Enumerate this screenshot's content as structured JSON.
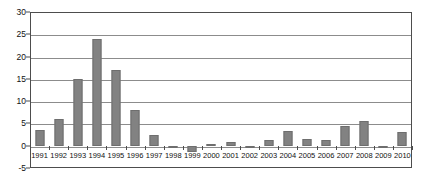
{
  "chart_data": {
    "type": "bar",
    "title": "",
    "subtitle": "",
    "xlabel": "",
    "ylabel": "",
    "categories": [
      "1991",
      "1992",
      "1993",
      "1994",
      "1995",
      "1996",
      "1997",
      "1998",
      "1999",
      "2000",
      "2001",
      "2002",
      "2003",
      "2004",
      "2005",
      "2006",
      "2007",
      "2008",
      "2009",
      "2010"
    ],
    "values": [
      3.5,
      6.0,
      15.0,
      24.0,
      17.0,
      8.0,
      2.5,
      -0.4,
      -1.5,
      0.4,
      0.8,
      -0.5,
      1.2,
      3.3,
      1.5,
      1.2,
      4.5,
      5.5,
      -0.4,
      3.0
    ],
    "ylim": [
      -5,
      30
    ],
    "ytick_step": 5,
    "yticks": [
      -5,
      0,
      5,
      10,
      15,
      20,
      25,
      30
    ],
    "ytick_labels": [
      "-5",
      "0",
      "5",
      "10",
      "15",
      "20",
      "25",
      "30"
    ],
    "grid": true,
    "grid_axis": "y",
    "legend": false,
    "legend_position": "none",
    "bar_color": "#828282",
    "bar_edge_color": "#6e6e6e",
    "grid_color": "#8c8c8c",
    "frame_color": "#4d4d4d",
    "background_color": "#ffffff",
    "text_color": "#111111"
  }
}
